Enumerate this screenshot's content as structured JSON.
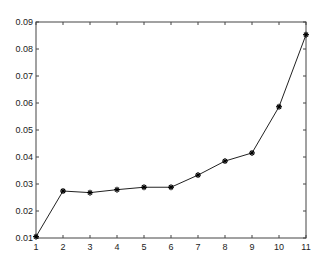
{
  "chart_data": {
    "type": "line",
    "title": "",
    "xlabel": "",
    "ylabel": "",
    "x": [
      1,
      2,
      3,
      4,
      5,
      6,
      7,
      8,
      9,
      10,
      11
    ],
    "series": [
      {
        "name": "",
        "marker": "*",
        "color": "#000000",
        "values": [
          0.0105,
          0.0274,
          0.0268,
          0.0279,
          0.0288,
          0.0288,
          0.0333,
          0.0385,
          0.0415,
          0.0586,
          0.0853
        ]
      }
    ],
    "xlim": [
      1,
      11
    ],
    "ylim": [
      0.01,
      0.09
    ],
    "xticks": [
      "1",
      "2",
      "3",
      "4",
      "5",
      "6",
      "7",
      "8",
      "9",
      "10",
      "11"
    ],
    "yticks": [
      "0.01",
      "0.02",
      "0.03",
      "0.04",
      "0.05",
      "0.06",
      "0.07",
      "0.08",
      "0.09"
    ],
    "grid": false,
    "legend": null
  }
}
